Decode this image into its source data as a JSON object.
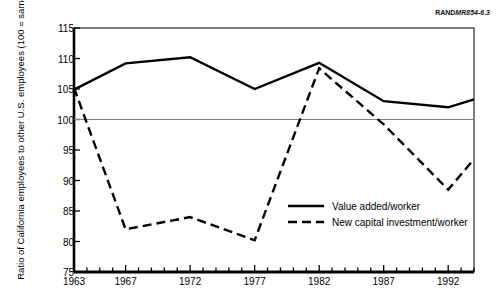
{
  "figure": {
    "source_id_bold": "RAND",
    "source_id_rest": "MR854-6.3"
  },
  "chart_data": {
    "type": "line",
    "title": "",
    "subtitle": "",
    "xlabel": "",
    "ylabel": "Ratio of California employees to other U.S. employees (100 = same)",
    "xlim": [
      1963,
      1994
    ],
    "ylim": [
      75,
      115
    ],
    "yticks": [
      75,
      80,
      85,
      90,
      95,
      100,
      105,
      110,
      115
    ],
    "ytick_labels": [
      "75",
      "80",
      "85",
      "90",
      "95",
      "100",
      "105",
      "110",
      "115"
    ],
    "xticks": [
      1963,
      1964,
      1965,
      1966,
      1967,
      1968,
      1969,
      1970,
      1971,
      1972,
      1973,
      1974,
      1975,
      1976,
      1977,
      1978,
      1979,
      1980,
      1981,
      1982,
      1983,
      1984,
      1985,
      1986,
      1987,
      1988,
      1989,
      1990,
      1991,
      1992,
      1993,
      1994
    ],
    "xtick_labels": [
      "1963",
      "1967",
      "1972",
      "1977",
      "1982",
      "1987",
      "1992"
    ],
    "xtick_label_years": [
      1963,
      1967,
      1972,
      1977,
      1982,
      1987,
      1992
    ],
    "grid": false,
    "reference_line": {
      "value": 100,
      "label": "100 = same",
      "color": "#808080"
    },
    "legend_position": "inside-right-lower",
    "x": [
      1963,
      1967,
      1972,
      1977,
      1982,
      1987,
      1992,
      1994
    ],
    "series": [
      {
        "name": "Value added/worker",
        "style": "solid",
        "color": "#000000",
        "values": [
          104.9,
          109.2,
          110.2,
          105.0,
          109.3,
          103.0,
          102.0,
          103.3
        ]
      },
      {
        "name": "New capital investment/worker",
        "style": "dashed",
        "color": "#000000",
        "values": [
          105.2,
          82.0,
          84.0,
          80.2,
          108.4,
          99.2,
          88.5,
          93.5
        ]
      }
    ]
  },
  "legend": {
    "items": [
      {
        "label": "Value added/worker",
        "style": "solid"
      },
      {
        "label": "New capital investment/worker",
        "style": "dashed"
      }
    ]
  }
}
